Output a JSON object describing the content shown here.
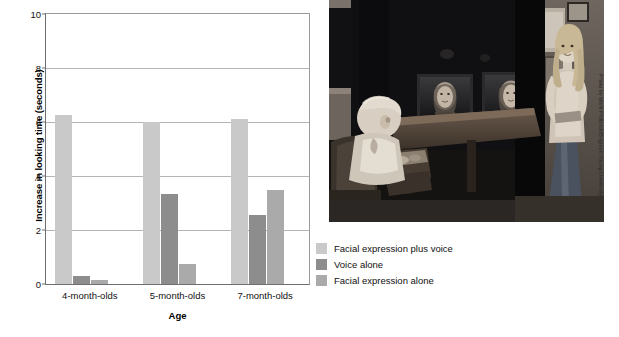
{
  "figure": {
    "photo_credit": "Photo by Mark Philbrick/Brigham Young University"
  },
  "chart_data": {
    "type": "bar",
    "title": "",
    "xlabel": "Age",
    "ylabel": "Increase in looking time (seconds)",
    "categories": [
      "4-month-olds",
      "5-month-olds",
      "7-month-olds"
    ],
    "series": [
      {
        "name": "Facial expression plus voice",
        "color": "#c9c9c9",
        "values": [
          6.25,
          6.0,
          6.1
        ]
      },
      {
        "name": "Voice alone",
        "color": "#8d8d8d",
        "values": [
          0.3,
          3.35,
          2.55
        ]
      },
      {
        "name": "Facial expression alone",
        "color": "#aaaaaa",
        "values": [
          0.15,
          0.75,
          3.5
        ]
      }
    ],
    "ylim": [
      0,
      10
    ],
    "yticks": [
      0,
      2,
      4,
      6,
      8,
      10
    ],
    "ytick_labels": [
      "0",
      "2",
      "4",
      "6",
      "8",
      "10"
    ],
    "grid": true,
    "legend_position": "bottom-right"
  },
  "legend": {
    "entries": [
      {
        "label": "Facial expression plus voice",
        "color": "#c9c9c9"
      },
      {
        "label": "Voice alone",
        "color": "#8d8d8d"
      },
      {
        "label": "Facial expression alone",
        "color": "#aaaaaa"
      }
    ]
  }
}
